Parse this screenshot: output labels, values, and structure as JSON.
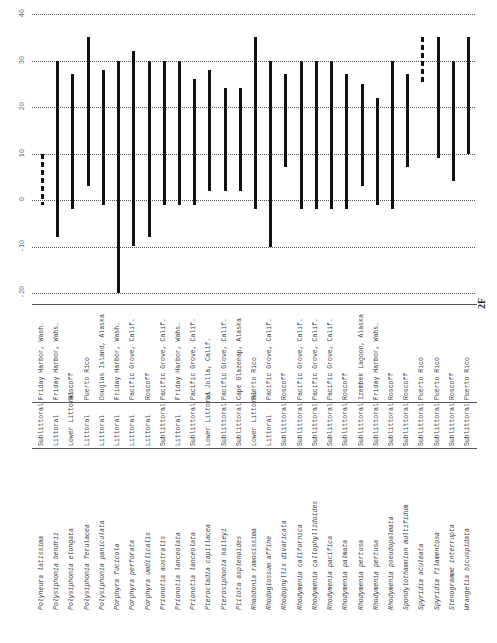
{
  "page_number": "2F",
  "chart_data": {
    "type": "range-bar",
    "orientation": "vertical bars, rotated page",
    "y_ticks": [
      "40",
      "30",
      "20",
      "10",
      "0",
      "-10",
      "-20"
    ],
    "ylim": [
      -20,
      40
    ],
    "grid": true,
    "categories": [
      "Polyneura latissima",
      "Polysiphonia bendrii",
      "Polysiphonia elongata",
      "Polysiphonia ferulacea",
      "Polysiphonia paniculata",
      "Porphyra fucicola",
      "Porphyra perforata",
      "Porphyra umbilicalis",
      "Prionotia australis",
      "Prionotia lanceolata",
      "Prionotia lanceolata",
      "Pterocladia capillacea",
      "Pterosiphonia baileyi",
      "Ptilota asplenoides",
      "Rhabdonia ramosissima",
      "Rhodoglossum affine",
      "Rhodophyllis divaricata",
      "Rhodymenia californica",
      "Rhodymenia callophyllidoides",
      "Rhodymenia pacifica",
      "Rhodymenia palmata",
      "Rhodymenia pertusa",
      "Rhodymenia pertusa",
      "Rhodymenia pseudopalmata",
      "Spondylothamnion multifidum",
      "Spyridia aculeata",
      "Spyridia filamentosa",
      "Stenogramme interrupta",
      "Wrangelia bicuspidata"
    ],
    "series": [
      {
        "name": "temperature range",
        "ranges": [
          [
            -1,
            10,
            "dashed"
          ],
          [
            -8,
            30
          ],
          [
            -2,
            27
          ],
          [
            3,
            35
          ],
          [
            -1,
            28
          ],
          [
            -20,
            30
          ],
          [
            -10,
            32
          ],
          [
            -8,
            30
          ],
          [
            -1,
            30
          ],
          [
            -1,
            30
          ],
          [
            -1,
            26
          ],
          [
            2,
            28
          ],
          [
            2,
            24
          ],
          [
            2,
            24
          ],
          [
            -2,
            35
          ],
          [
            -10,
            30
          ],
          [
            7,
            27
          ],
          [
            -2,
            30
          ],
          [
            -2,
            30
          ],
          [
            -2,
            30
          ],
          [
            -2,
            27
          ],
          [
            3,
            25
          ],
          [
            -1,
            22
          ],
          [
            -2,
            30
          ],
          [
            7,
            27
          ],
          [
            25,
            35,
            "dashed"
          ],
          [
            9,
            35
          ],
          [
            4,
            30
          ],
          [
            10,
            35
          ]
        ]
      }
    ]
  },
  "table": {
    "habitats": [
      "Sublittoral",
      "Littoral",
      "Lower Littoral",
      "Littoral",
      "Littoral",
      "Littoral",
      "Littoral",
      "Littoral",
      "Sublittoral",
      "Littoral",
      "Sublittoral",
      "Lower Littoral",
      "Sublittoral",
      "Sublittoral",
      "Lower Littoral",
      "Littoral",
      "Sublittoral",
      "Sublittoral",
      "Sublittoral",
      "Sublittoral",
      "Sublittoral",
      "Sublittoral",
      "Sublittoral",
      "Sublittoral",
      "Sublittoral",
      "Sublittoral",
      "Sublittoral",
      "Sublittoral",
      "Sublittoral"
    ],
    "localities": [
      "Friday Harbor, Wash.",
      "Friday Harbor, Wahs.",
      "Roscoff",
      "Puerto Rico",
      "Douglas Island, Alaska",
      "Friday Harbor, Wash.",
      "Pacific Grove, Calif.",
      "Roscoff",
      "Pacific Grove, Calif.",
      "Friday Harbor, Wahs.",
      "Pacific Grove, Calif.",
      "La Jolla, Calif.",
      "Pacific Grove, Calif.",
      "Cape Glazenap, Alaska",
      "Puerto Rico",
      "Pacific Grove, Calif.",
      "Roscoff",
      "Pacific Grove, Calif.",
      "Pacific Grove, Calif.",
      "Pacific Grove, Calif.",
      "Roscoff",
      "Izembek Lagoon, Alaska",
      "Friday Harbor, Wahs.",
      "Roscoff",
      "Roscoff",
      "Puerto Rico",
      "Puerto Rico",
      "Roscoff",
      "Puerto Rico"
    ]
  }
}
